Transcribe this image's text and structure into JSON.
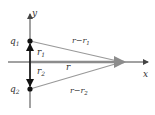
{
  "diagram": {
    "type": "vector-diagram",
    "axes": {
      "x_label": "x",
      "y_label": "y"
    },
    "charges": [
      {
        "label": "q",
        "sub": "1"
      },
      {
        "label": "q",
        "sub": "2"
      }
    ],
    "vectors": {
      "r1": {
        "label": "r",
        "sub": "1"
      },
      "r2": {
        "label": "r",
        "sub": "2"
      },
      "r": {
        "label": "r"
      },
      "r_minus_r1": {
        "label": "r−r",
        "sub": "1"
      },
      "r_minus_r2": {
        "label": "r−r",
        "sub": "2"
      }
    },
    "colors": {
      "axis": "#444444",
      "vector_r": "#8c8c8c",
      "line": "#999999",
      "point": "#111111"
    }
  }
}
